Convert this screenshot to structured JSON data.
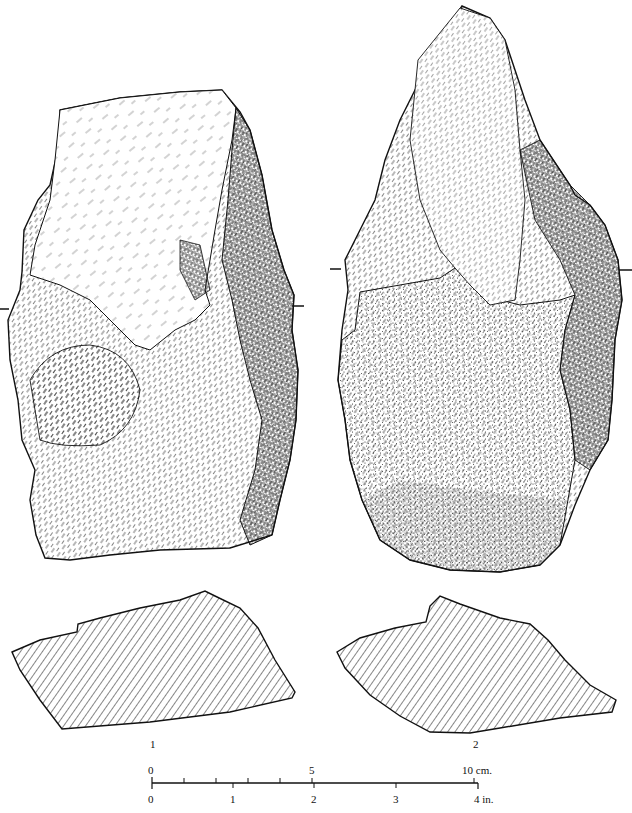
{
  "figure": {
    "artifacts": [
      {
        "id": "1",
        "label": "1",
        "view": "face with flake scars and shaded lateral edge"
      },
      {
        "id": "2",
        "label": "2",
        "view": "opposite face with stippled cortex"
      }
    ],
    "cross_sections": [
      {
        "artifact": "1",
        "fill": "diagonal hatching"
      },
      {
        "artifact": "2",
        "fill": "diagonal hatching"
      }
    ],
    "scale_bar": {
      "cm_labels": [
        "0",
        "5",
        "10 cm."
      ],
      "inch_labels": [
        "0",
        "1",
        "2",
        "3",
        "4 in."
      ],
      "cm_max": 10,
      "in_max": 4
    },
    "colors": {
      "ink": "#111111",
      "paper": "#ffffff"
    }
  }
}
